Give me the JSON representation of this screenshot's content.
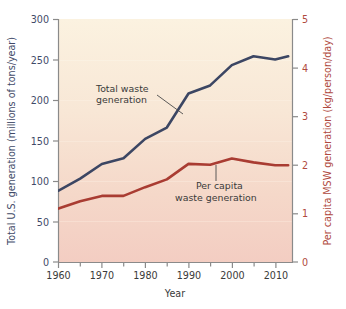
{
  "chart_data": {
    "type": "line",
    "title": "",
    "xlabel": "Year",
    "ylabel": "Total U.S. generation (millions of tons/year)",
    "y2label": "Per capita MSW generation (kg/person/day)",
    "x": [
      1960,
      1965,
      1970,
      1975,
      1980,
      1985,
      1990,
      1995,
      2000,
      2005,
      2010,
      2013
    ],
    "xlim": [
      1960,
      2014
    ],
    "ylim": [
      0,
      300
    ],
    "y2lim": [
      0,
      5
    ],
    "grid": false,
    "legend": "annotations",
    "xticks": [
      1960,
      1970,
      1980,
      1990,
      2000,
      2010
    ],
    "xtick_labels": [
      "1960",
      "1970",
      "1980",
      "1990",
      "2000",
      "2010"
    ],
    "xminorticks": [
      1965,
      1975,
      1985,
      1995,
      2005
    ],
    "yticks": [
      0,
      50,
      100,
      150,
      200,
      250,
      300
    ],
    "ytick_labels": [
      "0",
      "50",
      "100",
      "150",
      "200",
      "250",
      "300"
    ],
    "y2ticks": [
      0,
      1,
      2,
      3,
      4,
      5
    ],
    "y2tick_labels": [
      "0",
      "1",
      "2",
      "3",
      "4",
      "5"
    ],
    "series": [
      {
        "name": "Total waste generation",
        "axis": "left",
        "color": "#3c4663",
        "values": [
          88,
          103,
          121,
          128,
          152,
          166,
          208,
          218,
          243,
          254,
          250,
          254
        ]
      },
      {
        "name": "Per capita waste generation",
        "axis": "right",
        "color": "#a93c32",
        "values": [
          1.1,
          1.25,
          1.36,
          1.36,
          1.54,
          1.7,
          2.02,
          2.0,
          2.13,
          2.05,
          1.99,
          1.99
        ]
      }
    ],
    "annotations": [
      {
        "label_line1": "Total waste",
        "label_line2": "generation",
        "target_series": "Total waste generation"
      },
      {
        "label_line1": "Per capita",
        "label_line2": "waste generation",
        "target_series": "Per capita waste generation"
      }
    ],
    "colors": {
      "left_axis": "#3f4a68",
      "right_axis": "#b04a3e",
      "plot_bg_top": "#fbf1dd",
      "plot_bg_bottom": "#f4cfc4",
      "axis_line": "#8a8a8a",
      "annotation_text": "#3a3a3a",
      "leader_line": "#5a5a5a"
    }
  }
}
